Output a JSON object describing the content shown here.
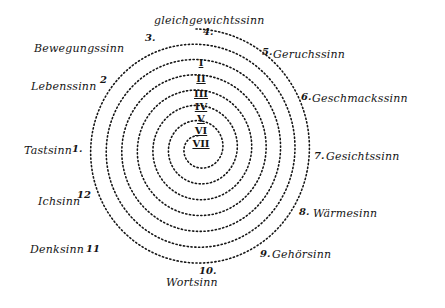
{
  "diagram": {
    "title": "gleichgewichtssinn",
    "center": {
      "x": 196,
      "y": 150
    },
    "senses": [
      {
        "number": "1.",
        "label": "Tastsinn"
      },
      {
        "number": "2",
        "label": "Lebenssinn"
      },
      {
        "number": "3.",
        "label": "Bewegungssinn"
      },
      {
        "number": "4.",
        "label": "Gleichgewichtssinn"
      },
      {
        "number": "5.",
        "label": "Geruchssinn"
      },
      {
        "number": "6.",
        "label": "Geschmackssinn"
      },
      {
        "number": "7.",
        "label": "Gesichtssinn"
      },
      {
        "number": "8.",
        "label": "Wärmesinn"
      },
      {
        "number": "9.",
        "label": "Gehörsinn"
      },
      {
        "number": "10.",
        "label": "Wortsinn"
      },
      {
        "number": "11",
        "label": "Denksinn"
      },
      {
        "number": "12",
        "label": "Ichsinn"
      }
    ],
    "spiral_turns": [
      "I",
      "II",
      "III",
      "IV",
      "V",
      "VI",
      "VII"
    ],
    "ink_color": "#151515",
    "background": "#ffffff"
  }
}
